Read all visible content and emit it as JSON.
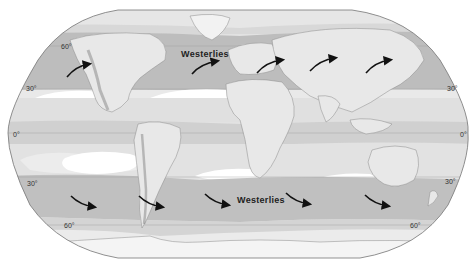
{
  "map": {
    "type": "world-map-robinson",
    "theme": "prevailing-winds",
    "colors": {
      "background": "#ffffff",
      "band_dark": "#bdbdbd",
      "band_mid": "#cfcfcf",
      "band_light": "#e2e2e2",
      "polar_light": "#ececec",
      "calm_patch": "#ffffff",
      "land_outline": "#8a8a8a",
      "arrow": "#111111",
      "graticule": "#9a9a9a",
      "border": "#777777"
    },
    "labels": {
      "westerlies_north": "Westerlies",
      "westerlies_south": "Westerlies"
    },
    "latitude_labels": {
      "left": [
        {
          "text": "60°",
          "lat": 60
        },
        {
          "text": "30°",
          "lat": 30
        },
        {
          "text": "0°",
          "lat": 0
        },
        {
          "text": "30°",
          "lat": -30
        },
        {
          "text": "60°",
          "lat": -60
        }
      ],
      "right": [
        {
          "text": "30°",
          "lat": 30
        },
        {
          "text": "0°",
          "lat": 0
        },
        {
          "text": "30°",
          "lat": -30
        },
        {
          "text": "60°",
          "lat": -60
        }
      ]
    },
    "arrows": {
      "north_westerlies_count": 5,
      "south_westerlies_count": 5,
      "north_direction": "southwest-to-northeast",
      "south_direction": "northwest-to-southeast"
    },
    "bands": [
      {
        "name": "polar-north",
        "lat_range": [
          60,
          90
        ],
        "shade": "light"
      },
      {
        "name": "westerlies-north",
        "lat_range": [
          30,
          60
        ],
        "shade": "dark"
      },
      {
        "name": "horse-latitudes-north",
        "lat_range": [
          25,
          30
        ],
        "shade": "calm"
      },
      {
        "name": "trade-winds-north",
        "lat_range": [
          5,
          25
        ],
        "shade": "light"
      },
      {
        "name": "doldrums",
        "lat_range": [
          -5,
          5
        ],
        "shade": "mid"
      },
      {
        "name": "trade-winds-south",
        "lat_range": [
          -25,
          -5
        ],
        "shade": "light"
      },
      {
        "name": "horse-latitudes-south",
        "lat_range": [
          -30,
          -25
        ],
        "shade": "calm"
      },
      {
        "name": "westerlies-south",
        "lat_range": [
          -60,
          -30
        ],
        "shade": "dark"
      },
      {
        "name": "polar-south",
        "lat_range": [
          -90,
          -60
        ],
        "shade": "light"
      }
    ]
  }
}
